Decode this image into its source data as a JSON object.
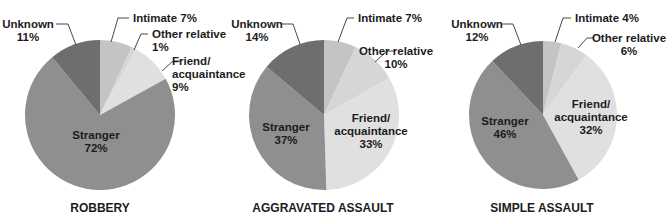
{
  "chart_data": [
    {
      "type": "pie",
      "title": "ROBBERY",
      "slices": [
        {
          "label": "Intimate",
          "value": 7
        },
        {
          "label": "Other relative",
          "value": 1
        },
        {
          "label": "Friend/ acquaintance",
          "value": 9
        },
        {
          "label": "Stranger",
          "value": 72
        },
        {
          "label": "Unknown",
          "value": 11
        }
      ]
    },
    {
      "type": "pie",
      "title": "AGGRAVATED ASSAULT",
      "slices": [
        {
          "label": "Intimate",
          "value": 7
        },
        {
          "label": "Other relative",
          "value": 10
        },
        {
          "label": "Friend/ acquaintance",
          "value": 33
        },
        {
          "label": "Stranger",
          "value": 37
        },
        {
          "label": "Unknown",
          "value": 14
        }
      ]
    },
    {
      "type": "pie",
      "title": "SIMPLE ASSAULT",
      "slices": [
        {
          "label": "Intimate",
          "value": 4
        },
        {
          "label": "Other relative",
          "value": 6
        },
        {
          "label": "Friend/ acquaintance",
          "value": 32
        },
        {
          "label": "Stranger",
          "value": 46
        },
        {
          "label": "Unknown",
          "value": 12
        }
      ]
    }
  ],
  "colors": {
    "Intimate": "#c4c4c4",
    "Other relative": "#d6d6d6",
    "Friend/ acquaintance": "#e0e0e0",
    "Stranger": "#8f8f8f",
    "Unknown": "#6e6e6e",
    "leader": "#333333",
    "text": "#1c1c1c"
  },
  "layout": [
    {
      "cx": 100,
      "cy": 115,
      "r": 75,
      "title_x": 100,
      "title_y": 212,
      "labels": [
        {
          "lines": [
            "Intimate 7%"
          ],
          "x": 133,
          "y": 22,
          "anchor": "start",
          "leader": [
            [
              129,
              18
            ],
            [
              118,
              18
            ],
            [
              111,
              42
            ]
          ]
        },
        {
          "lines": [
            "Other relative",
            "1%"
          ],
          "x": 152,
          "y": 38,
          "anchor": "start",
          "leader": [
            [
              148,
              34
            ],
            [
              141,
              34
            ],
            [
              134,
              50
            ]
          ]
        },
        {
          "lines": [
            "Friend/",
            "acquaintance",
            "9%"
          ],
          "x": 172,
          "y": 65,
          "anchor": "start",
          "leader": [
            [
              181,
              61
            ],
            [
              173,
              61
            ],
            [
              162,
              71
            ]
          ]
        },
        {
          "lines": [
            "Stranger",
            "72%"
          ],
          "x": 96,
          "y": 139,
          "anchor": "middle",
          "inside": true
        },
        {
          "lines": [
            "Unknown",
            "11%"
          ],
          "x": 28,
          "y": 28,
          "anchor": "middle",
          "leader": [
            [
              56,
              24
            ],
            [
              68,
              24
            ],
            [
              76,
              45
            ]
          ]
        }
      ]
    },
    {
      "cx": 324,
      "cy": 115,
      "r": 75,
      "title_x": 323,
      "title_y": 212,
      "labels": [
        {
          "lines": [
            "Intimate 7%"
          ],
          "x": 358,
          "y": 22,
          "anchor": "start",
          "leader": [
            [
              354,
              18
            ],
            [
              347,
              18
            ],
            [
              338,
              42
            ]
          ]
        },
        {
          "lines": [
            "Other relative",
            "10%"
          ],
          "x": 396,
          "y": 55,
          "anchor": "middle",
          "leader": [
            [
              395,
              51
            ],
            [
              387,
              51
            ],
            [
              375,
              62
            ]
          ]
        },
        {
          "lines": [
            "Friend/",
            "acquaintance",
            "33%"
          ],
          "x": 371,
          "y": 122,
          "anchor": "middle",
          "inside": true
        },
        {
          "lines": [
            "Stranger",
            "37%"
          ],
          "x": 286,
          "y": 131,
          "anchor": "middle",
          "inside": true
        },
        {
          "lines": [
            "Unknown",
            "14%"
          ],
          "x": 257,
          "y": 28,
          "anchor": "middle",
          "leader": [
            [
              281,
              24
            ],
            [
              293,
              24
            ],
            [
              300,
              44
            ]
          ]
        }
      ]
    },
    {
      "cx": 543,
      "cy": 115,
      "r": 74,
      "title_x": 542,
      "title_y": 212,
      "labels": [
        {
          "lines": [
            "Intimate 4%"
          ],
          "x": 575,
          "y": 22,
          "anchor": "start",
          "leader": [
            [
              571,
              18
            ],
            [
              563,
              18
            ],
            [
              555,
              42
            ]
          ]
        },
        {
          "lines": [
            "Other relative",
            "6%"
          ],
          "x": 629,
          "y": 42,
          "anchor": "middle",
          "leader": [
            [
              594,
              38
            ],
            [
              587,
              38
            ],
            [
              578,
              48
            ]
          ]
        },
        {
          "lines": [
            "Friend/",
            "acquaintance",
            "32%"
          ],
          "x": 591,
          "y": 108,
          "anchor": "middle",
          "inside": true
        },
        {
          "lines": [
            "Stranger",
            "46%"
          ],
          "x": 505,
          "y": 125,
          "anchor": "middle",
          "inside": true
        },
        {
          "lines": [
            "Unknown",
            "12%"
          ],
          "x": 477,
          "y": 28,
          "anchor": "middle",
          "leader": [
            [
              501,
              24
            ],
            [
              513,
              24
            ],
            [
              521,
              45
            ]
          ]
        }
      ]
    }
  ]
}
